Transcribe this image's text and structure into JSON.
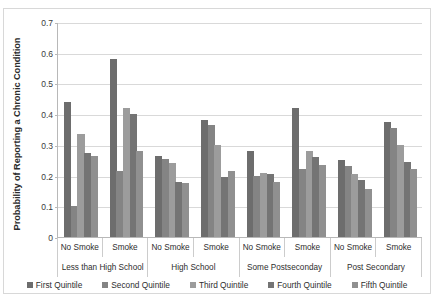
{
  "chart_data": {
    "type": "bar",
    "title": "",
    "xlabel": "",
    "ylabel": "Probability of Reporting a Chronic Condition",
    "ylim": [
      0,
      0.7
    ],
    "ytick_labels": [
      "0",
      "0.1",
      "0.2",
      "0.3",
      "0.4",
      "0.5",
      "0.6",
      "0.7"
    ],
    "ytick_values": [
      0,
      0.1,
      0.2,
      0.3,
      0.4,
      0.5,
      0.6,
      0.7
    ],
    "grid": true,
    "legend_position": "bottom",
    "group_labels": [
      "Less than High School",
      "High School",
      "Some Postseconday",
      "Post Secondary"
    ],
    "subgroup_labels": [
      "No Smoke",
      "Smoke"
    ],
    "categories": [
      "Less than High School / No Smoke",
      "Less than High School / Smoke",
      "High School / No Smoke",
      "High School / Smoke",
      "Some Postseconday / No Smoke",
      "Some Postseconday / Smoke",
      "Post Secondary / No Smoke",
      "Post Secondary / Smoke"
    ],
    "series": [
      {
        "name": "First Quintile",
        "color": "#6d6d6d",
        "values": [
          0.44,
          0.58,
          0.265,
          0.38,
          0.28,
          0.42,
          0.25,
          0.375
        ]
      },
      {
        "name": "Second Quintile",
        "color": "#848484",
        "values": [
          0.1,
          0.215,
          0.255,
          0.365,
          0.2,
          0.22,
          0.23,
          0.355
        ]
      },
      {
        "name": "Third Quintile",
        "color": "#9c9c9c",
        "values": [
          0.335,
          0.42,
          0.24,
          0.3,
          0.21,
          0.28,
          0.205,
          0.3
        ]
      },
      {
        "name": "Fourth Quintile",
        "color": "#747474",
        "values": [
          0.275,
          0.4,
          0.18,
          0.195,
          0.205,
          0.26,
          0.185,
          0.245
        ]
      },
      {
        "name": "Fifth Quintile",
        "color": "#909090",
        "values": [
          0.265,
          0.28,
          0.175,
          0.215,
          0.18,
          0.235,
          0.155,
          0.22
        ]
      }
    ]
  },
  "footnote": ""
}
